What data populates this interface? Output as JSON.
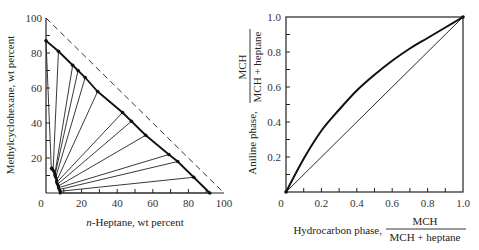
{
  "chart_data": [
    {
      "type": "scatter",
      "subtype": "ternary-tie-line-diagram",
      "title": "",
      "xlabel": "n-Heptane, wt percent",
      "ylabel": "Methylcyclohexane, wt percent",
      "xlim": [
        0,
        100
      ],
      "ylim": [
        0,
        100
      ],
      "xticks": [
        "0",
        "20",
        "40",
        "60",
        "80",
        "100"
      ],
      "yticks": [
        "20",
        "40",
        "60",
        "80",
        "100"
      ],
      "dashed_line": {
        "from": [
          0,
          100
        ],
        "to": [
          100,
          0
        ],
        "style": "dashed"
      },
      "hydrocarbon_phase_boundary": [
        [
          0,
          87
        ],
        [
          7,
          81
        ],
        [
          15,
          73
        ],
        [
          18,
          70
        ],
        [
          22,
          66
        ],
        [
          29,
          58
        ],
        [
          43,
          46
        ],
        [
          48,
          41
        ],
        [
          56,
          33
        ],
        [
          69,
          22
        ],
        [
          74,
          18
        ],
        [
          83,
          9
        ],
        [
          92,
          0
        ]
      ],
      "aniline_phase_boundary": [
        [
          3,
          15
        ],
        [
          4,
          13
        ],
        [
          5,
          11
        ],
        [
          5.5,
          9
        ],
        [
          6,
          7
        ],
        [
          6.5,
          5
        ],
        [
          7,
          3.5
        ],
        [
          7.5,
          2
        ],
        [
          8,
          1
        ],
        [
          8,
          0
        ]
      ],
      "tie_lines": [
        {
          "aniline": [
            3,
            14
          ],
          "hydrocarbon": [
            0,
            87
          ]
        },
        {
          "aniline": [
            4,
            13
          ],
          "hydrocarbon": [
            7,
            81
          ]
        },
        {
          "aniline": [
            5,
            11
          ],
          "hydrocarbon": [
            15,
            73
          ]
        },
        {
          "aniline": [
            5,
            10
          ],
          "hydrocarbon": [
            18,
            70
          ]
        },
        {
          "aniline": [
            5.5,
            9
          ],
          "hydrocarbon": [
            22,
            66
          ]
        },
        {
          "aniline": [
            6,
            7
          ],
          "hydrocarbon": [
            29,
            58
          ]
        },
        {
          "aniline": [
            6,
            6
          ],
          "hydrocarbon": [
            43,
            46
          ]
        },
        {
          "aniline": [
            6.5,
            5
          ],
          "hydrocarbon": [
            48,
            41
          ]
        },
        {
          "aniline": [
            7,
            4
          ],
          "hydrocarbon": [
            56,
            33
          ]
        },
        {
          "aniline": [
            7,
            3
          ],
          "hydrocarbon": [
            69,
            22
          ]
        },
        {
          "aniline": [
            7.5,
            2
          ],
          "hydrocarbon": [
            74,
            18
          ]
        },
        {
          "aniline": [
            8,
            1
          ],
          "hydrocarbon": [
            83,
            9
          ]
        },
        {
          "aniline": [
            8,
            0
          ],
          "hydrocarbon": [
            92,
            0
          ]
        }
      ],
      "grid": false
    },
    {
      "type": "line",
      "title": "",
      "xlabel": "Hydrocarbon phase, MCH / (MCH + heptane)",
      "ylabel": "Aniline phase, MCH / (MCH + heptane)",
      "xlim": [
        0,
        1.0
      ],
      "ylim": [
        0,
        1.0
      ],
      "xticks": [
        "0",
        "0.2",
        "0.4",
        "0.6",
        "0.8",
        "1.0"
      ],
      "yticks": [
        "0.2",
        "0.4",
        "0.6",
        "0.8",
        "1.0"
      ],
      "series": [
        {
          "name": "Equilibrium curve",
          "style": "thick",
          "x": [
            0,
            0.1,
            0.2,
            0.3,
            0.4,
            0.5,
            0.6,
            0.7,
            0.8,
            0.9,
            1.0
          ],
          "y": [
            0,
            0.19,
            0.35,
            0.47,
            0.58,
            0.67,
            0.75,
            0.82,
            0.88,
            0.94,
            1.0
          ]
        },
        {
          "name": "Diagonal y = x",
          "style": "thin",
          "x": [
            0,
            1.0
          ],
          "y": [
            0,
            1.0
          ]
        }
      ],
      "grid": false,
      "legend": "none"
    }
  ],
  "left": {
    "xlabel_italic": "n",
    "xlabel_rest": "-Heptane, wt percent",
    "ylabel": "Methylcyclohexane, wt percent",
    "origin_label": "0",
    "xticks": [
      "20",
      "40",
      "60",
      "80",
      "100"
    ],
    "yticks": [
      "20",
      "40",
      "60",
      "80",
      "100"
    ]
  },
  "right": {
    "xlabel_prefix": "Hydrocarbon phase,",
    "frac_num": "MCH",
    "frac_den": "MCH + heptane",
    "ylabel_prefix": "Aniline phase,",
    "origin_label": "0",
    "xticks": [
      "0.2",
      "0.4",
      "0.6",
      "0.8",
      "1.0"
    ],
    "yticks": [
      "0.2",
      "0.4",
      "0.6",
      "0.8",
      "1.0"
    ]
  }
}
